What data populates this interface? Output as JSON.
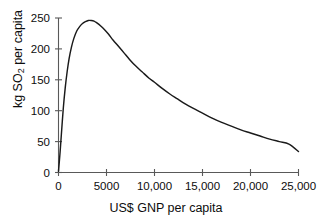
{
  "chart_data": {
    "type": "line",
    "title": "",
    "xlabel": "US$ GNP per capita",
    "ylabel_text": "kg SO",
    "ylabel_sub": "2",
    "ylabel_tail": " per capita",
    "ylabel_full": "kg SO2 per capita",
    "xlim": [
      0,
      25000
    ],
    "ylim": [
      0,
      250
    ],
    "grid": false,
    "legend": "none",
    "line_color": "#1a1a1a",
    "axis_color": "#4d4d4d",
    "xticks": [
      0,
      5000,
      10000,
      15000,
      20000,
      25000
    ],
    "xtick_labels": [
      "0",
      "5000",
      "10,000",
      "15,000",
      "20,000",
      "25,000"
    ],
    "yticks": [
      0,
      50,
      100,
      150,
      200,
      250
    ],
    "ytick_labels": [
      "0",
      "50",
      "100",
      "150",
      "200",
      "250"
    ],
    "series": [
      {
        "name": "SO2 emissions per capita",
        "x": [
          0,
          150,
          300,
          500,
          700,
          900,
          1100,
          1350,
          1600,
          1900,
          2200,
          2500,
          2800,
          3100,
          3400,
          3700,
          4000,
          4400,
          4800,
          5200,
          5700,
          6200,
          6800,
          7400,
          8000,
          8700,
          9400,
          10000,
          10800,
          11600,
          12400,
          13200,
          14000,
          15000,
          16000,
          17000,
          18000,
          19000,
          20000,
          21000,
          22000,
          23000,
          24000,
          25000
        ],
        "y": [
          2,
          30,
          62,
          104,
          137,
          163,
          184,
          203,
          217,
          229,
          236,
          241,
          244,
          246,
          246,
          245,
          242,
          237,
          231,
          224,
          214,
          205,
          194,
          183,
          173,
          163,
          153,
          146,
          136,
          127,
          119,
          111,
          104,
          96,
          88,
          81,
          75,
          69,
          64,
          59,
          54,
          50,
          46,
          34
        ]
      }
    ]
  }
}
